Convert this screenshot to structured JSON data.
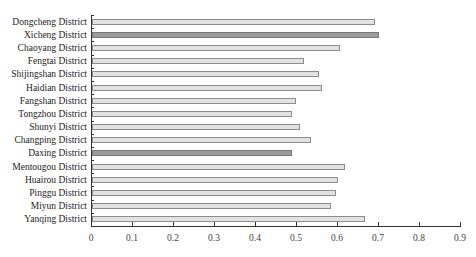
{
  "chart_data": {
    "type": "bar",
    "orientation": "horizontal",
    "title": "",
    "xlabel": "",
    "ylabel": "",
    "xlim": [
      0,
      0.9
    ],
    "x_ticks": [
      "0",
      "0.1",
      "0.2",
      "0.3",
      "0.4",
      "0.5",
      "0.6",
      "0.7",
      "0.8",
      "0.9"
    ],
    "grid": false,
    "legend": null,
    "categories": [
      "Dongcheng District",
      "Xicheng District",
      "Chaoyang District",
      "Fengtai District",
      "Shijingshan District",
      "Haidian District",
      "Fangshan District",
      "Tongzhou District",
      "Shunyi District",
      "Changping District",
      "Daxing District",
      "Mentougou District",
      "Huairou District",
      "Pinggu District",
      "Miyun District",
      "Yanqing District"
    ],
    "values": [
      0.69,
      0.7,
      0.605,
      0.517,
      0.554,
      0.561,
      0.498,
      0.488,
      0.507,
      0.534,
      0.488,
      0.617,
      0.6,
      0.595,
      0.583,
      0.666
    ],
    "highlighted": [
      false,
      true,
      false,
      false,
      false,
      false,
      false,
      false,
      false,
      false,
      true,
      false,
      false,
      false,
      false,
      false
    ],
    "colors": {
      "normal": "#e2e2e2",
      "highlight": "#9c9c9c",
      "border": "#8c8c8c"
    }
  }
}
